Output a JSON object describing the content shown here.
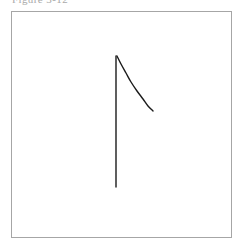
{
  "figure": {
    "caption": "Figure 3-12",
    "caption_visible": "clipped",
    "background_color": "#ffffff",
    "frame": {
      "border_color": "#a6a6a6",
      "border_width_px": 1,
      "x": 11,
      "y": 11,
      "width": 221,
      "height": 227
    },
    "ink_color": "#1a1a1a"
  },
  "chart_data": {
    "type": "line",
    "title": "Figure 3-12",
    "subtitle": "",
    "xlabel": "",
    "ylabel": "",
    "xlim": [
      0,
      221
    ],
    "ylim": [
      0,
      227
    ],
    "grid": false,
    "legend": "none",
    "axes_style": "single vertical axis line, no ticks, no tick labels, enclosing rectangular frame",
    "annotations": [],
    "series": [
      {
        "name": "vertical-axis-line",
        "role": "axis",
        "type": "line",
        "color": "#1a1a1a",
        "width_px": 1.4,
        "points": [
          {
            "x": 116,
            "y": 56
          },
          {
            "x": 116,
            "y": 187
          }
        ]
      },
      {
        "name": "decay-curve",
        "role": "data",
        "type": "curve",
        "shape": "convex decreasing (exponential-decay-like)",
        "color": "#1a1a1a",
        "width_px": 1.4,
        "points": [
          {
            "x": 117,
            "y": 56
          },
          {
            "x": 121,
            "y": 64
          },
          {
            "x": 126,
            "y": 73
          },
          {
            "x": 131,
            "y": 82
          },
          {
            "x": 137,
            "y": 91
          },
          {
            "x": 143,
            "y": 99
          },
          {
            "x": 148,
            "y": 106
          },
          {
            "x": 153,
            "y": 111
          }
        ]
      }
    ]
  }
}
